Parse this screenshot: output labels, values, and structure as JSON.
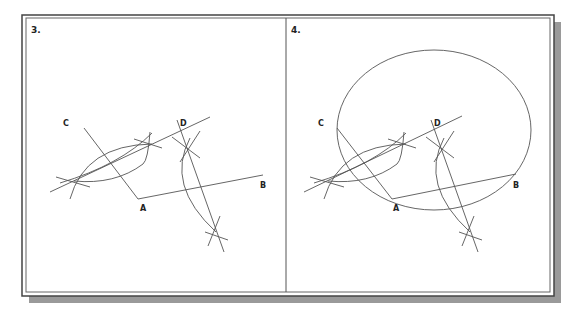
{
  "colors": {
    "line": "#555555",
    "frame": "#444444",
    "shadow": "#9a9a9a",
    "background": "#ffffff"
  },
  "panels": [
    {
      "number_label": "3.",
      "points": {
        "A": {
          "label": "A"
        },
        "B": {
          "label": "B"
        },
        "C": {
          "label": "C"
        },
        "D": {
          "label": "D"
        }
      }
    },
    {
      "number_label": "4.",
      "points": {
        "A": {
          "label": "A"
        },
        "B": {
          "label": "B"
        },
        "C": {
          "label": "C"
        },
        "D": {
          "label": "D"
        }
      }
    }
  ]
}
